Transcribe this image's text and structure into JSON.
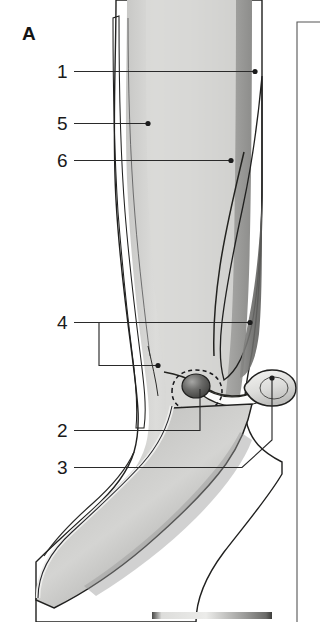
{
  "figure": {
    "panel_letter": "A",
    "width": 320,
    "height": 622,
    "background_color": "#ffffff"
  },
  "callouts": [
    {
      "id": "callout-1",
      "number": "1",
      "label_x": 57,
      "label_y": 78,
      "leader_path": "M 74 71.5 L 255 71.5",
      "dot_x": 255,
      "dot_y": 71.5,
      "has_dot": true
    },
    {
      "id": "callout-5",
      "number": "5",
      "label_x": 57,
      "label_y": 130,
      "leader_path": "M 74 123.5 L 148 123.5",
      "dot_x": 148,
      "dot_y": 123.5,
      "has_dot": true
    },
    {
      "id": "callout-6",
      "number": "6",
      "label_x": 57,
      "label_y": 167,
      "leader_path": "M 74 160.5 L 231 160.5",
      "dot_x": 231,
      "dot_y": 160.5,
      "has_dot": true
    },
    {
      "id": "callout-4",
      "number": "4",
      "label_x": 57,
      "label_y": 329,
      "leader_path": "M 74 322.5 L 99 322.5 L 99 365.5 L 158 365.5 M 99 322.5 L 250 322.5",
      "dot_x": 250,
      "dot_y": 322.5,
      "has_dot": true,
      "dot2_x": 158,
      "dot2_y": 365.5,
      "bracket": true
    },
    {
      "id": "callout-2",
      "number": "2",
      "label_x": 57,
      "label_y": 437,
      "leader_path": "M 74 430.5 L 200 430.5 L 200 389",
      "dot_x": 200,
      "dot_y": 389,
      "has_dot": false
    },
    {
      "id": "callout-3",
      "number": "3",
      "label_x": 57,
      "label_y": 474,
      "leader_path": "M 74 467.5 L 242 467.5 L 272 440 L 272 378",
      "dot_x": 272,
      "dot_y": 378,
      "has_dot": true
    }
  ],
  "panel_divider": {
    "name": "adjacent-panel-border",
    "x": 297,
    "y_top": 22,
    "y_bottom": 622,
    "color": "#555555"
  },
  "bottom_strip": {
    "name": "next-panel-top-edge",
    "x": 152,
    "y": 612,
    "width": 120,
    "height": 7
  },
  "structures": [
    {
      "name": "limb-outer-contour",
      "kind": "outline"
    },
    {
      "name": "skin-subcutaneous-layer",
      "kind": "band"
    },
    {
      "name": "humerus-shaft",
      "kind": "bone"
    },
    {
      "name": "triceps-muscle-belly",
      "kind": "muscle"
    },
    {
      "name": "olecranon-bursa",
      "kind": "dark-oval",
      "dashed": true
    },
    {
      "name": "joint-capsule-recess",
      "kind": "bulb"
    },
    {
      "name": "forearm-segment",
      "kind": "limb"
    }
  ],
  "palette": {
    "ink": "#20201f",
    "leader": "#2a2a2a",
    "text": "#1a1a1a",
    "light_tissue": "#e3e3e1",
    "mid_tissue": "#b8b8b6",
    "dark_tissue": "#8e8e8c",
    "deep_shadow": "#5a5a58",
    "white_fill": "#fbfbfa"
  }
}
